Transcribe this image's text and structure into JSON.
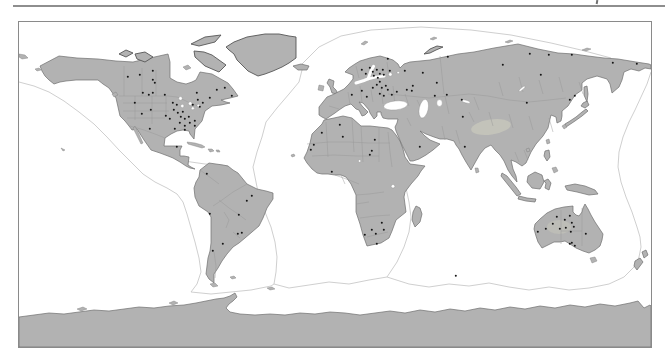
{
  "figure": {
    "type": "world-map-dot-distribution",
    "colors": {
      "ocean": "#ffffff",
      "land": "#b2b2b2",
      "coast": "#6f6f6f",
      "border": "#979797",
      "plate": "#c9c9c9",
      "marker": "#151515",
      "frame": "#8a8a8a",
      "rule": "#8e8e8e",
      "highland": "#c8c8bc"
    },
    "markers": [
      [
        109,
        55
      ],
      [
        121,
        53
      ],
      [
        134,
        49
      ],
      [
        134,
        58
      ],
      [
        136,
        61
      ],
      [
        124,
        71
      ],
      [
        130,
        73
      ],
      [
        134,
        71
      ],
      [
        146,
        73
      ],
      [
        116,
        81
      ],
      [
        123,
        92
      ],
      [
        132,
        88
      ],
      [
        154,
        81
      ],
      [
        158,
        83
      ],
      [
        155,
        88
      ],
      [
        159,
        91
      ],
      [
        164,
        90
      ],
      [
        162,
        95
      ],
      [
        166,
        97
      ],
      [
        170,
        95
      ],
      [
        147,
        94
      ],
      [
        151,
        97
      ],
      [
        161,
        101
      ],
      [
        166,
        104
      ],
      [
        171,
        101
      ],
      [
        176,
        99
      ],
      [
        179,
        78
      ],
      [
        178,
        71
      ],
      [
        174,
        83
      ],
      [
        181,
        85
      ],
      [
        184,
        81
      ],
      [
        191,
        76
      ],
      [
        198,
        68
      ],
      [
        206,
        66
      ],
      [
        213,
        74
      ],
      [
        176,
        104
      ],
      [
        166,
        108
      ],
      [
        156,
        107
      ],
      [
        131,
        107
      ],
      [
        158,
        125
      ],
      [
        188,
        152
      ],
      [
        191,
        192
      ],
      [
        220,
        193
      ],
      [
        233,
        174
      ],
      [
        228,
        179
      ],
      [
        223,
        211
      ],
      [
        219,
        212
      ],
      [
        204,
        222
      ],
      [
        194,
        229
      ],
      [
        343,
        48
      ],
      [
        347,
        52
      ],
      [
        351,
        46
      ],
      [
        354,
        50
      ],
      [
        358,
        48
      ],
      [
        355,
        54
      ],
      [
        359,
        56
      ],
      [
        361,
        52
      ],
      [
        364,
        48
      ],
      [
        365,
        53
      ],
      [
        371,
        49
      ],
      [
        361,
        60
      ],
      [
        358,
        63
      ],
      [
        354,
        66
      ],
      [
        363,
        66
      ],
      [
        367,
        64
      ],
      [
        369,
        68
      ],
      [
        343,
        69
      ],
      [
        333,
        73
      ],
      [
        348,
        75
      ],
      [
        361,
        72
      ],
      [
        365,
        74
      ],
      [
        373,
        73
      ],
      [
        378,
        70
      ],
      [
        388,
        68
      ],
      [
        394,
        64
      ],
      [
        386,
        49
      ],
      [
        404,
        51
      ],
      [
        418,
        61
      ],
      [
        428,
        73
      ],
      [
        369,
        37
      ],
      [
        429,
        35
      ],
      [
        484,
        43
      ],
      [
        511,
        32
      ],
      [
        530,
        33
      ],
      [
        522,
        53
      ],
      [
        553,
        33
      ],
      [
        594,
        41
      ],
      [
        618,
        42
      ],
      [
        551,
        78
      ],
      [
        556,
        74
      ],
      [
        508,
        81
      ],
      [
        393,
        69
      ],
      [
        416,
        74
      ],
      [
        443,
        78
      ],
      [
        444,
        95
      ],
      [
        401,
        125
      ],
      [
        446,
        125
      ],
      [
        321,
        103
      ],
      [
        303,
        111
      ],
      [
        324,
        115
      ],
      [
        295,
        123
      ],
      [
        292,
        128
      ],
      [
        356,
        118
      ],
      [
        353,
        129
      ],
      [
        351,
        133
      ],
      [
        313,
        150
      ],
      [
        363,
        201
      ],
      [
        365,
        208
      ],
      [
        357,
        212
      ],
      [
        353,
        208
      ],
      [
        346,
        213
      ],
      [
        358,
        222
      ],
      [
        519,
        210
      ],
      [
        527,
        207
      ],
      [
        534,
        202
      ],
      [
        538,
        195
      ],
      [
        546,
        198
      ],
      [
        551,
        194
      ],
      [
        553,
        201
      ],
      [
        555,
        205
      ],
      [
        547,
        206
      ],
      [
        541,
        207
      ],
      [
        552,
        210
      ],
      [
        567,
        212
      ],
      [
        553,
        221
      ],
      [
        556,
        224
      ],
      [
        551,
        222
      ],
      [
        437,
        254
      ]
    ]
  }
}
